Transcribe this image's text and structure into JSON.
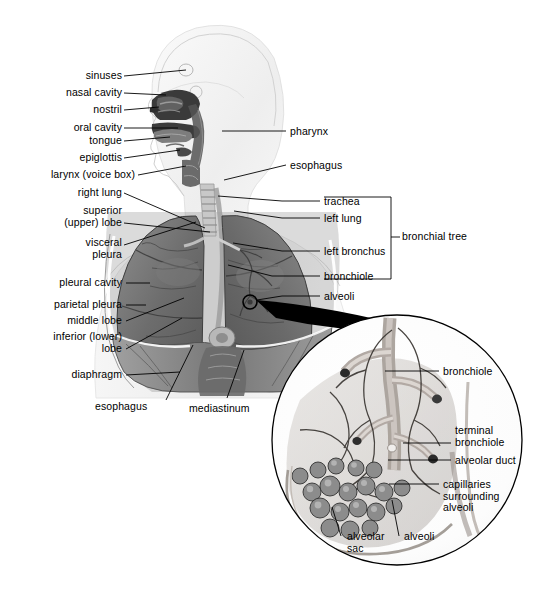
{
  "diagram": {
    "background_color": "#ffffff",
    "line_color": "#000000",
    "text_color": "#000000"
  },
  "labels_upper_left": [
    {
      "text": "sinuses",
      "x": 34,
      "y": 70,
      "align": "right",
      "w": 88,
      "line": [
        124,
        76,
        186,
        70
      ]
    },
    {
      "text": "nasal cavity",
      "x": 18,
      "y": 87,
      "align": "right",
      "w": 104,
      "line": [
        124,
        93,
        166,
        95
      ]
    },
    {
      "text": "nostril",
      "x": 38,
      "y": 104,
      "align": "right",
      "w": 84,
      "line": [
        124,
        110,
        159,
        107
      ]
    },
    {
      "text": "oral cavity",
      "x": 24,
      "y": 122,
      "align": "right",
      "w": 98,
      "line": [
        124,
        128,
        178,
        128
      ]
    },
    {
      "text": "tongue",
      "x": 34,
      "y": 135,
      "align": "right",
      "w": 88,
      "line": [
        124,
        141,
        170,
        137
      ]
    },
    {
      "text": "epiglottis",
      "x": 26,
      "y": 152,
      "align": "right",
      "w": 96,
      "line": [
        124,
        158,
        180,
        150
      ]
    },
    {
      "text": "larynx (voice box)",
      "x": 25,
      "y": 169,
      "align": "right",
      "w": 110,
      "line": [
        138,
        175,
        186,
        166
      ]
    }
  ],
  "labels_left": [
    {
      "text": "right lung",
      "x": 28,
      "y": 187,
      "align": "right",
      "w": 94,
      "line": [
        124,
        193,
        205,
        228
      ]
    },
    {
      "text": "superior\n(upper) lobe",
      "x": 26,
      "y": 205,
      "align": "right",
      "w": 96,
      "line": [
        124,
        223,
        210,
        232
      ]
    },
    {
      "text": "visceral\npleura",
      "x": 30,
      "y": 237,
      "align": "right",
      "w": 92,
      "line": [
        124,
        245,
        196,
        222
      ]
    },
    {
      "text": "pleural cavity",
      "x": 30,
      "y": 277,
      "align": "right",
      "w": 92,
      "line": [
        126,
        283,
        150,
        283
      ]
    },
    {
      "text": "parietal pleura",
      "x": 24,
      "y": 299,
      "align": "right",
      "w": 98,
      "line": [
        126,
        305,
        146,
        305
      ]
    },
    {
      "text": "middle lobe",
      "x": 28,
      "y": 315,
      "align": "right",
      "w": 94,
      "line": [
        126,
        321,
        184,
        298
      ]
    },
    {
      "text": "inferior (lower)\nlobe",
      "x": 24,
      "y": 331,
      "align": "right",
      "w": 98,
      "line": [
        126,
        349,
        182,
        318
      ]
    },
    {
      "text": "diaphragm",
      "x": 28,
      "y": 369,
      "align": "right",
      "w": 94,
      "line": [
        126,
        375,
        180,
        372
      ]
    }
  ],
  "labels_bottom": [
    {
      "text": "esophagus",
      "x": 95,
      "y": 401,
      "align": "left",
      "w": 70,
      "line": [
        166,
        400,
        193,
        345
      ]
    },
    {
      "text": "mediastinum",
      "x": 189,
      "y": 403,
      "align": "left",
      "w": 76,
      "line": [
        227,
        398,
        244,
        350
      ]
    }
  ],
  "labels_right": [
    {
      "text": "pharynx",
      "x": 290,
      "y": 126,
      "align": "left",
      "w": 70,
      "line": [
        222,
        131,
        286,
        131
      ]
    },
    {
      "text": "esophagus",
      "x": 290,
      "y": 160,
      "align": "left",
      "w": 70,
      "line": [
        224,
        180,
        286,
        165
      ]
    }
  ],
  "bronchial_tree": {
    "bracket_label": "bronchial tree",
    "bracket_label_x": 402,
    "bracket_label_y": 231,
    "bracket_x": 324,
    "bracket_top": 197,
    "bracket_bottom": 279,
    "bracket_right": 391,
    "tick_y": 237,
    "items": [
      {
        "text": "trachea",
        "x": 324,
        "y": 196,
        "line": [
          282,
          201,
          320,
          201
        ],
        "anchor": [
          218,
          196
        ]
      },
      {
        "text": "left lung",
        "x": 324,
        "y": 213,
        "line": [
          282,
          218,
          320,
          218
        ],
        "anchor": [
          234,
          211
        ]
      },
      {
        "text": "left bronchus",
        "x": 324,
        "y": 246,
        "line": [
          282,
          251,
          320,
          251
        ],
        "anchor": [
          233,
          243
        ]
      },
      {
        "text": "bronchiole",
        "x": 324,
        "y": 271,
        "line": [
          272,
          276,
          320,
          276
        ],
        "anchor": [
          228,
          265
        ]
      }
    ],
    "alveoli": {
      "text": "alveoli",
      "x": 324,
      "y": 291,
      "line": [
        282,
        296,
        320,
        296
      ]
    }
  },
  "inset": {
    "center_x": 397,
    "center_y": 440,
    "radius": 126,
    "marker": {
      "x": 250,
      "y": 302,
      "r": 7
    },
    "labels": [
      {
        "text": "bronchiole",
        "x": 443,
        "y": 366,
        "align": "left",
        "w": 80,
        "line": [
          385,
          371,
          439,
          371
        ]
      },
      {
        "text": "terminal\nbronchiole",
        "x": 455,
        "y": 425,
        "align": "left",
        "w": 80,
        "line": [
          403,
          443,
          451,
          443
        ]
      },
      {
        "text": "alveolar duct",
        "x": 455,
        "y": 455,
        "align": "left",
        "w": 86,
        "line": [
          388,
          460,
          451,
          460
        ]
      },
      {
        "text": "capillaries\nsurrounding\nalveoli",
        "x": 443,
        "y": 479,
        "align": "left",
        "w": 84,
        "line": [
          389,
          484,
          439,
          484
        ]
      },
      {
        "text": "alveolar\nsac",
        "x": 347,
        "y": 531,
        "align": "left",
        "w": 52,
        "line": [
          341,
          536,
          332,
          507
        ]
      },
      {
        "text": "alveoli",
        "x": 404,
        "y": 531,
        "align": "left",
        "w": 48,
        "line": [
          399,
          536,
          392,
          500
        ]
      }
    ]
  }
}
